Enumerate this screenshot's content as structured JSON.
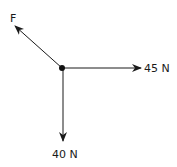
{
  "diagram": {
    "type": "free-body-diagram",
    "point": {
      "x": 62,
      "y": 68
    },
    "forces": [
      {
        "id": "F",
        "label": "F",
        "direction": "up-left",
        "tip": {
          "x": 15,
          "y": 26
        },
        "label_pos": {
          "x": 10,
          "y": 22
        }
      },
      {
        "id": "right",
        "label": "45 N",
        "direction": "right",
        "tip": {
          "x": 141,
          "y": 68
        },
        "label_pos": {
          "x": 144,
          "y": 72
        }
      },
      {
        "id": "down",
        "label": "40 N",
        "direction": "down",
        "tip": {
          "x": 63,
          "y": 141
        },
        "label_pos": {
          "x": 52,
          "y": 158
        }
      }
    ],
    "colors": {
      "line": "#1a1a1a",
      "background": "#ffffff"
    }
  }
}
